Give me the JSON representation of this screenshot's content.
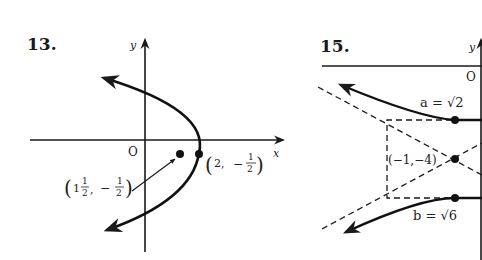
{
  "problems": [
    {
      "number": "13.",
      "type": "parabola",
      "axes": {
        "x_label": "x",
        "y_label": "y",
        "origin_label": "O"
      },
      "vertex": {
        "label_open": "(",
        "label_x": "2,",
        "label_sign": "−",
        "label_num": "1",
        "label_den": "2",
        "label_close": ")"
      },
      "focus": {
        "label_open": "(",
        "label_whole": "1",
        "label_fnum": "1",
        "label_fden": "2",
        "label_sep": ",",
        "label_sign": "−",
        "label_num": "1",
        "label_den": "2",
        "label_close": ")"
      }
    },
    {
      "number": "15.",
      "type": "hyperbola",
      "axes": {
        "y_label": "y",
        "origin_label": "O"
      },
      "center_label": "(−1,−4)",
      "a_label": "a = √2",
      "b_label": "b = √6"
    }
  ]
}
